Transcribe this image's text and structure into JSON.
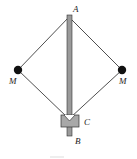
{
  "diagram": {
    "type": "centrifugal-governor",
    "labels": {
      "top_pivot": "A",
      "bottom_end": "B",
      "collar": "C",
      "left_mass": "M",
      "right_mass": "M"
    },
    "colors": {
      "line": "#222222",
      "rod_fill": "#9a9a9a",
      "collar_fill": "#a8a8a8",
      "mass_fill": "#111111"
    }
  }
}
